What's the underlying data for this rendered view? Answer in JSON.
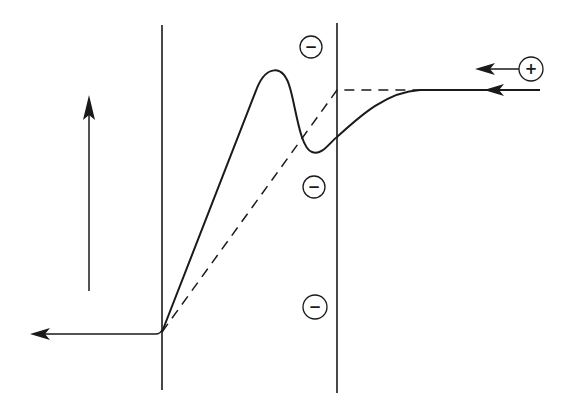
{
  "diagram": {
    "colors": {
      "ink": "#1a1a1a",
      "background": "#ffffff"
    },
    "elements": {
      "left_boundary": {
        "kind": "vertical-line"
      },
      "right_boundary": {
        "kind": "vertical-line"
      },
      "vertical_arrow": {
        "kind": "arrow",
        "direction": "up"
      },
      "outflow_arrow": {
        "kind": "arrow",
        "direction": "left"
      },
      "inflow_arrow": {
        "kind": "arrow",
        "direction": "left"
      },
      "positive_ion_arrow": {
        "kind": "arrow",
        "direction": "left"
      },
      "solid_curve": {
        "kind": "curve",
        "style": "solid",
        "shape": "rises steeply to a peak, dips to a trough, then levels off to a plateau"
      },
      "dashed_curve": {
        "kind": "curve",
        "style": "dashed",
        "shape": "linear rise across layer, then horizontal plateau"
      }
    },
    "charges": {
      "negative": [
        {
          "symbol": "−",
          "label": "negative-charge-top"
        },
        {
          "symbol": "−",
          "label": "negative-charge-middle"
        },
        {
          "symbol": "−",
          "label": "negative-charge-bottom"
        }
      ],
      "positive": [
        {
          "symbol": "+",
          "label": "positive-charge"
        }
      ]
    }
  }
}
